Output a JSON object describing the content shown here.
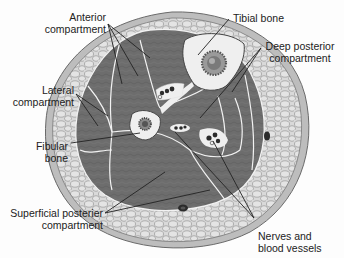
{
  "diagram": {
    "colors": {
      "skin_ring": "#bdbdbd",
      "subcutaneous_fat": "#d9d9d9",
      "fat_cell_outline": "#8a8a8a",
      "muscle": "#6f6f6f",
      "muscle_dark": "#5e5e5e",
      "fascia": "#f0f0f0",
      "bone_cortex": "#eeeeee",
      "bone_marrow": "#8c8c8c",
      "vessel": "#2b2b2b",
      "leader_line": "#222222",
      "label_text": "#222222"
    },
    "labels": {
      "anterior": {
        "line1": "Anterior",
        "line2": "compartment"
      },
      "tibial": {
        "line1": "Tibial bone"
      },
      "deep_posterior": {
        "line1": "Deep posterior",
        "line2": "compartment"
      },
      "lateral": {
        "line1": "Lateral",
        "line2": "compartment"
      },
      "fibular": {
        "line1": "Fibular",
        "line2": "bone"
      },
      "superficial_posterior": {
        "line1": "Superficial posterier",
        "line2": "compartment"
      },
      "nerves": {
        "line1": "Nerves and",
        "line2": "blood vessels"
      }
    }
  }
}
